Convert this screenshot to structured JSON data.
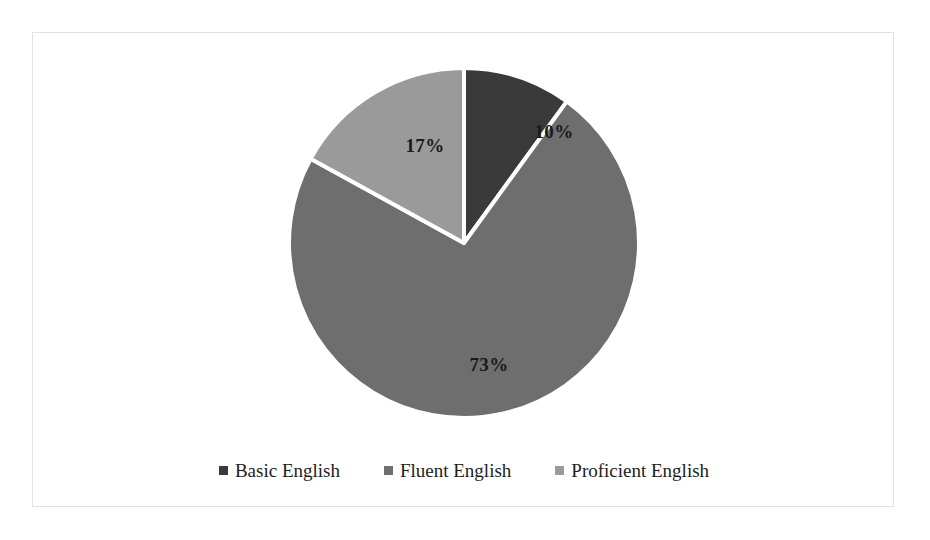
{
  "chart_data": {
    "type": "pie",
    "title": "",
    "subtitle": "",
    "xlabel": "",
    "ylabel": "",
    "grid": false,
    "legend_position": "bottom",
    "start_angle_deg": 0,
    "direction": "clockwise",
    "categories": [
      "Basic English",
      "Fluent English",
      "Proficient English"
    ],
    "values": [
      10,
      73,
      17
    ],
    "value_unit": "%",
    "data_labels": [
      "10%",
      "73%",
      "17%"
    ],
    "colors": [
      "#3a3a3a",
      "#6e6e6e",
      "#9a9a9a"
    ],
    "separator_color": "#ffffff",
    "slices": [
      {
        "label": "Basic English",
        "value": 10,
        "data_label": "10%",
        "color": "#3a3a3a",
        "start_angle_deg": 0,
        "end_angle_deg": 36
      },
      {
        "label": "Fluent English",
        "value": 73,
        "data_label": "73%",
        "color": "#6e6e6e",
        "start_angle_deg": 36,
        "end_angle_deg": 298.8
      },
      {
        "label": "Proficient English",
        "value": 17,
        "data_label": "17%",
        "color": "#9a9a9a",
        "start_angle_deg": 298.8,
        "end_angle_deg": 360
      }
    ]
  },
  "legend": {
    "items": [
      {
        "label": "Basic English",
        "color": "#3a3a3a"
      },
      {
        "label": "Fluent English",
        "color": "#6e6e6e"
      },
      {
        "label": "Proficient English",
        "color": "#9a9a9a"
      }
    ]
  },
  "labels": {
    "basic": "10%",
    "fluent": "73%",
    "proficient": "17%"
  },
  "style": {
    "background": "#ffffff",
    "frame_color": "#e2e2e2",
    "text_color": "#1a1a1a"
  }
}
